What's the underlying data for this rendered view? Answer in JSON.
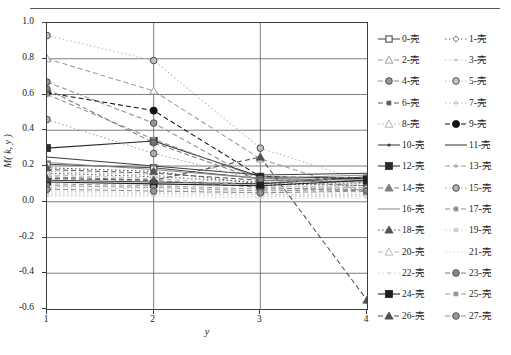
{
  "figure": {
    "rule_top": true
  },
  "axes": {
    "ylabel": "M( k, y )",
    "xlabel": "y",
    "yticks": [
      "1.0",
      "0.8",
      "0.6",
      "0.4",
      "0.2",
      "0.0",
      "-0.2",
      "-0.4",
      "-0.6"
    ],
    "ytick_values": [
      1.0,
      0.8,
      0.6,
      0.4,
      0.2,
      0.0,
      -0.2,
      -0.4,
      -0.6
    ],
    "xticks": [
      "1",
      "2",
      "3",
      "4"
    ],
    "xtick_values": [
      1,
      2,
      3,
      4
    ]
  },
  "chart_data": {
    "type": "line",
    "title": "",
    "xlabel": "y",
    "ylabel": "M( k, y )",
    "x": [
      1,
      2,
      3,
      4
    ],
    "xlim": [
      1,
      4
    ],
    "ylim": [
      -0.6,
      1.0
    ],
    "grid": true,
    "legend_position": "right",
    "legend_columns": 2,
    "series": [
      {
        "name": "0-壳",
        "values": [
          0.21,
          0.19,
          0.13,
          0.12
        ],
        "color": "#4a4a4a",
        "marker": "square-open",
        "dash": "solid"
      },
      {
        "name": "1-壳",
        "values": [
          0.16,
          0.14,
          0.11,
          0.1
        ],
        "color": "#6e6e6e",
        "marker": "diamond-open",
        "dash": "dot"
      },
      {
        "name": "2-壳",
        "values": [
          0.8,
          0.62,
          0.24,
          0.05
        ],
        "color": "#9a9a9a",
        "marker": "triangle-open",
        "dash": "dash"
      },
      {
        "name": "3-壳",
        "values": [
          0.06,
          0.05,
          0.04,
          0.04
        ],
        "color": "#c9c9c9",
        "marker": "dot-small",
        "dash": "dot"
      },
      {
        "name": "4-壳",
        "values": [
          0.67,
          0.44,
          0.11,
          0.09
        ],
        "color": "#8c8c8c",
        "marker": "circle-ring",
        "dash": "dash"
      },
      {
        "name": "5-壳",
        "values": [
          0.93,
          0.79,
          0.3,
          0.11
        ],
        "color": "#bdbdbd",
        "marker": "circle-ring",
        "dash": "dot"
      },
      {
        "name": "6-壳",
        "values": [
          0.18,
          0.16,
          0.12,
          0.11
        ],
        "color": "#5c5c5c",
        "marker": "square-small",
        "dash": "dash"
      },
      {
        "name": "7-壳",
        "values": [
          0.08,
          0.07,
          0.05,
          0.05
        ],
        "color": "#c4c4c4",
        "marker": "plus-small",
        "dash": "dot"
      },
      {
        "name": "8-壳",
        "values": [
          0.17,
          0.15,
          0.09,
          0.07
        ],
        "color": "#b0b0b0",
        "marker": "triangle-open",
        "dash": "dot"
      },
      {
        "name": "9-壳",
        "values": [
          0.61,
          0.51,
          0.14,
          0.13
        ],
        "color": "#111111",
        "marker": "circle-fill",
        "dash": "dash"
      },
      {
        "name": "10-壳",
        "values": [
          0.12,
          0.11,
          0.1,
          0.14
        ],
        "color": "#3a3a3a",
        "marker": "dot-small",
        "dash": "solid"
      },
      {
        "name": "11-壳",
        "values": [
          0.25,
          0.2,
          0.15,
          0.16
        ],
        "color": "#3a3a3a",
        "marker": "none",
        "dash": "solid"
      },
      {
        "name": "12-壳",
        "values": [
          0.3,
          0.34,
          0.14,
          0.13
        ],
        "color": "#2b2b2b",
        "marker": "square-fill",
        "dash": "solid"
      },
      {
        "name": "13-壳",
        "values": [
          0.1,
          0.09,
          0.07,
          0.08
        ],
        "color": "#9e9e9e",
        "marker": "plus-small",
        "dash": "dash"
      },
      {
        "name": "14-壳",
        "values": [
          0.14,
          0.12,
          0.08,
          0.06
        ],
        "color": "#7d7d7d",
        "marker": "triangle-fill",
        "dash": "dash"
      },
      {
        "name": "15-壳",
        "values": [
          0.46,
          0.27,
          0.12,
          0.1
        ],
        "color": "#a8a8a8",
        "marker": "circle-ring",
        "dash": "dot"
      },
      {
        "name": "16-壳",
        "values": [
          0.22,
          0.18,
          0.13,
          0.15
        ],
        "color": "#8a8a8a",
        "marker": "none",
        "dash": "solid"
      },
      {
        "name": "17-壳",
        "values": [
          0.6,
          0.35,
          0.13,
          0.12
        ],
        "color": "#909090",
        "marker": "square-small",
        "dash": "dash"
      },
      {
        "name": "18-壳",
        "values": [
          0.19,
          0.17,
          0.1,
          0.09
        ],
        "color": "#555555",
        "marker": "triangle-fill",
        "dash": "dot"
      },
      {
        "name": "19-壳",
        "values": [
          0.04,
          0.04,
          0.03,
          0.03
        ],
        "color": "#d0d0d0",
        "marker": "square-small",
        "dash": "dot"
      },
      {
        "name": "20-壳",
        "values": [
          0.15,
          0.13,
          0.09,
          0.08
        ],
        "color": "#b8b8b8",
        "marker": "triangle-open",
        "dash": "dash"
      },
      {
        "name": "21-壳",
        "values": [
          0.03,
          0.03,
          0.02,
          0.02
        ],
        "color": "#dcdcdc",
        "marker": "none",
        "dash": "dot"
      },
      {
        "name": "22-壳",
        "values": [
          0.05,
          0.05,
          0.04,
          0.03
        ],
        "color": "#d8d8d8",
        "marker": "dot-small",
        "dash": "dot"
      },
      {
        "name": "23-壳",
        "values": [
          0.63,
          0.33,
          0.12,
          0.11
        ],
        "color": "#7a7a7a",
        "marker": "circle-ring",
        "dash": "dash"
      },
      {
        "name": "24-壳",
        "values": [
          0.11,
          0.1,
          0.09,
          0.12
        ],
        "color": "#1f1f1f",
        "marker": "square-fill",
        "dash": "solid"
      },
      {
        "name": "25-壳",
        "values": [
          0.09,
          0.08,
          0.06,
          0.07
        ],
        "color": "#999999",
        "marker": "square-small",
        "dash": "dash"
      },
      {
        "name": "26-壳",
        "values": [
          0.13,
          0.12,
          0.25,
          -0.55
        ],
        "color": "#4f4f4f",
        "marker": "triangle-fill",
        "dash": "dash"
      },
      {
        "name": "27-壳",
        "values": [
          0.07,
          0.06,
          0.05,
          0.06
        ],
        "color": "#8f8f8f",
        "marker": "circle-ring",
        "dash": "dash"
      }
    ]
  }
}
